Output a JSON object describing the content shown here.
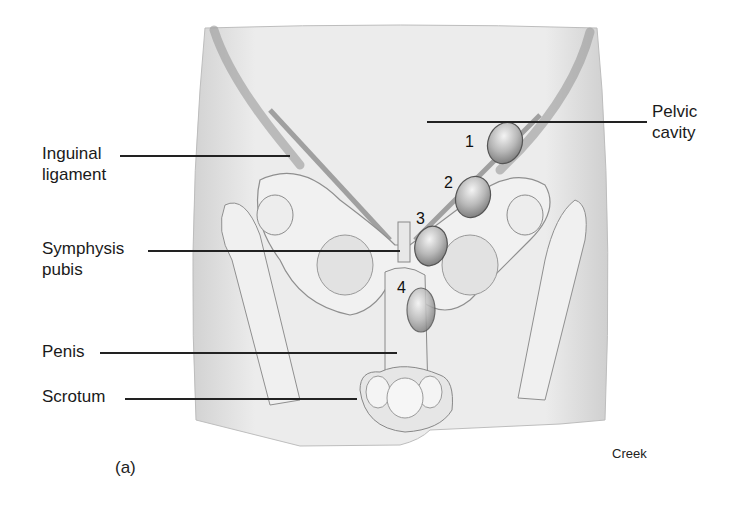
{
  "figure": {
    "panel_label": "(a)",
    "credit": "Creek",
    "labels": {
      "inguinal_ligament": [
        "Inguinal",
        "ligament"
      ],
      "symphysis_pubis": [
        "Symphysis",
        "pubis"
      ],
      "penis": "Penis",
      "scrotum": "Scrotum",
      "pelvic_cavity": [
        "Pelvic",
        "cavity"
      ]
    },
    "markers": [
      "1",
      "2",
      "3",
      "4"
    ],
    "colors": {
      "skin": "#e6e6e6",
      "skin_shadow": "#c8c8c8",
      "bone": "#f2f2f2",
      "outline": "#8a8a8a",
      "oval": "#a9a9a9",
      "text": "#1a1a1a"
    }
  }
}
